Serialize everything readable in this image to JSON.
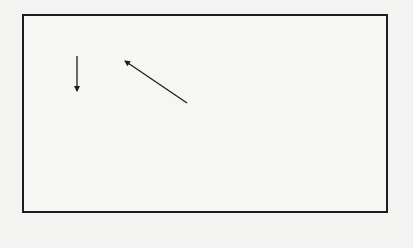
{
  "diagram": {
    "nodes": {
      "landlady": {
        "name": "LANDLADY",
        "desc": "(kindly middle-class woman)"
      },
      "maria": {
        "name": "MARIA",
        "desc": "(beautiful prostitute)"
      },
      "young_businessman": {
        "line1": "YOUNG",
        "line2": "BUSINESSMAN",
        "line3": "(“Nephew”;",
        "line4": "narrator of preface)"
      },
      "harry": {
        "line1": "HARRY HALLER",
        "line2": "THE “STEPPENWOLF”"
      },
      "hermine": {
        "name": "HERMINE",
        "desc": "(prostitute)"
      },
      "professor": {
        "line1": "PROFESSOR",
        "line2": "(has smug",
        "line3": "middle-class",
        "line4": "values)"
      },
      "erica": {
        "name": "ERICA",
        "desc": "(pretty young woman)"
      },
      "pablo": {
        "name": "PABLO",
        "desc": "(jazz musician)"
      }
    },
    "edges": {
      "aunt_of": "aunt of",
      "rents_room_from": "rents room from",
      "lovers": "lovers",
      "friends": "friends",
      "fascinated_1": "fascinated",
      "fascinated_2": "by",
      "shows_1": "shows",
      "shows_2": "him life's",
      "shows_3": "sensual side",
      "kills": "kills",
      "despises": "despises",
      "unhappy_1": "unhappy",
      "unhappy_2": "lovers",
      "disagree_1": "disagree",
      "disagree_2": "about music",
      "casual_friends": "casual friends",
      "intimate_1": "intimate",
      "intimate_2": "friends"
    },
    "colors": {
      "line": "#1d1d1d",
      "background": "#f3f3f1"
    }
  }
}
